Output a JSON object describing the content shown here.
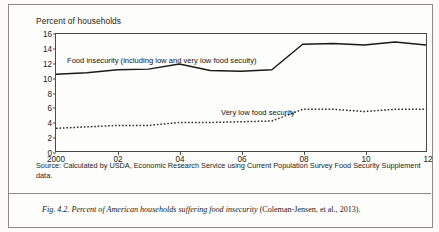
{
  "figure": {
    "axis_note": "Percent of households",
    "source": "Source: Calculated by USDA, Economic Research Service using Current Population Survey Food Security Supplement data.",
    "caption_label": "Fig. 4.2.",
    "caption_italic": "Percent of American households suffering food insecurity",
    "caption_ref": "(Coleman-Jensen, et al., 2013)."
  },
  "chart_data": {
    "type": "line",
    "title": "",
    "subtitle": "",
    "xlabel": "",
    "ylabel": "Percent of households",
    "xlim": [
      2000,
      2012
    ],
    "ylim": [
      0,
      16
    ],
    "yticks": [
      0,
      2,
      4,
      6,
      8,
      10,
      12,
      14,
      16
    ],
    "ytick_labels": [
      "0",
      "2",
      "4",
      "6",
      "8",
      "10",
      "12",
      "14",
      "16"
    ],
    "xticks": [
      2000,
      2002,
      2004,
      2006,
      2008,
      2010,
      2012
    ],
    "xtick_labels": [
      "2000",
      "02",
      "04",
      "06",
      "08",
      "10",
      "12"
    ],
    "grid": false,
    "legend_position": "inline-annotations",
    "x": [
      2000,
      2001,
      2002,
      2003,
      2004,
      2005,
      2006,
      2007,
      2008,
      2009,
      2010,
      2011,
      2012
    ],
    "series": [
      {
        "name": "Food insecurity (including low and very low food secuity)",
        "style": "solid",
        "color": "#1a1a1a",
        "values": [
          10.5,
          10.7,
          11.1,
          11.2,
          11.9,
          11.0,
          10.9,
          11.1,
          14.6,
          14.7,
          14.5,
          14.9,
          14.5
        ]
      },
      {
        "name": "Very low food security",
        "style": "dotted",
        "color": "#2b2b2b",
        "values": [
          3.1,
          3.3,
          3.5,
          3.5,
          3.9,
          3.9,
          4.0,
          4.1,
          5.7,
          5.7,
          5.4,
          5.7,
          5.7
        ]
      }
    ],
    "annotations": [
      {
        "text": "Food insecurity (including low and very low food secuity)",
        "x": 2000.3,
        "y": 12.9
      },
      {
        "text": "Very low food security",
        "x": 2005.1,
        "y": 6.7
      }
    ]
  }
}
